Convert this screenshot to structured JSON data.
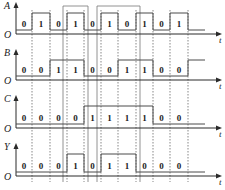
{
  "diagram": {
    "title": "",
    "time_axis_label": "t",
    "origin_label": "O",
    "cell_boundaries_x": [
      16,
      32,
      50,
      67,
      84,
      101,
      118,
      136,
      153,
      170,
      188
    ],
    "tail_end_x": 205,
    "axis_end_x": 222,
    "signals": [
      {
        "name": "A",
        "bits": [
          "0",
          "1",
          "0",
          "1",
          "0",
          "1",
          "0",
          "1",
          "0",
          "1"
        ],
        "after": "0",
        "base_y": 34,
        "high_y": 13,
        "low_y": 30
      },
      {
        "name": "B",
        "bits": [
          "0",
          "0",
          "1",
          "1",
          "0",
          "0",
          "1",
          "1",
          "0",
          "0"
        ],
        "after": "1",
        "base_y": 80,
        "high_y": 60,
        "low_y": 76
      },
      {
        "name": "C",
        "bits": [
          "0",
          "0",
          "0",
          "0",
          "1",
          "1",
          "1",
          "1",
          "0",
          "0"
        ],
        "after": "0",
        "base_y": 128,
        "high_y": 106,
        "low_y": 124
      },
      {
        "name": "Y",
        "bits": [
          "0",
          "0",
          "0",
          "1",
          "0",
          "1",
          "1",
          "0",
          "0",
          "0"
        ],
        "after": "0",
        "base_y": 176,
        "high_y": 154,
        "low_y": 172
      }
    ],
    "highlight_boxes": [
      {
        "x1": 63,
        "x2": 88,
        "top_y": 6
      },
      {
        "x1": 97,
        "x2": 140,
        "top_y": 6
      }
    ],
    "dashed_line_bottom_y": 182,
    "colors": {
      "wave": "#4a4a4a",
      "axis": "#2a2a2a",
      "dash": "#555555",
      "box": "#777777",
      "text": "#222222"
    }
  }
}
